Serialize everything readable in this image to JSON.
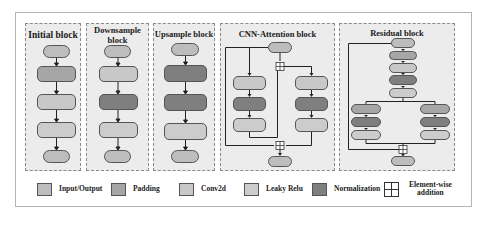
{
  "blocks": {
    "initial": {
      "title": "Initial block"
    },
    "downsample": {
      "title_line1": "Downsample",
      "title_line2": "block"
    },
    "upsample": {
      "title": "Upsample block"
    },
    "cnn_attention": {
      "title": "CNN-Attention block"
    },
    "residual": {
      "title": "Residual block"
    }
  },
  "legend": [
    {
      "label": "Input/Output",
      "color": "#bdbdbd"
    },
    {
      "label": "Padding",
      "color": "#a6a6a6"
    },
    {
      "label": "Conv2d",
      "color": "#c8c8c8"
    },
    {
      "label": "Leaky Relu",
      "color": "#cccccc"
    },
    {
      "label": "Normalization",
      "color": "#7f7f7f"
    },
    {
      "label_line1": "Element-wise",
      "label_line2": "addition",
      "icon": "plus-box-icon"
    }
  ],
  "colors": {
    "panel_bg": "#ececec",
    "io": "#bdbdbd",
    "padding": "#a6a6a6",
    "conv2d": "#c8c8c8",
    "leaky_relu": "#cccccc",
    "normalization": "#7f7f7f"
  }
}
